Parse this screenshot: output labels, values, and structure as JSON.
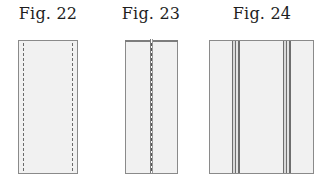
{
  "figures": [
    {
      "label": "Fig. 22",
      "description": "rectangle with dashed stitch lines along both long edges"
    },
    {
      "label": "Fig. 23",
      "description": "rectangle with central seam and dashed stitch line, folded top edge"
    },
    {
      "label": "Fig. 24",
      "description": "wide rectangle with two vertical double-line stripes"
    }
  ],
  "colors": {
    "panel_fill": "#f1f1f1",
    "outline": "#8a8a8a",
    "stitch": "#6a6a6a"
  }
}
